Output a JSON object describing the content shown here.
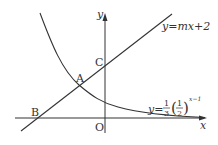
{
  "diagram": {
    "axes": {
      "x_label": "x",
      "y_label": "y",
      "origin_label": "O"
    },
    "points": {
      "A": "A",
      "B": "B",
      "C": "C"
    },
    "line": {
      "label_prefix": "y=",
      "label_expr": "mx+2"
    },
    "curve": {
      "label_prefix": "y=",
      "coef_num": "1",
      "coef_den": "3",
      "base_num": "1",
      "base_den": "2",
      "exponent": "x−1",
      "lparen": "(",
      "rparen": ")"
    }
  }
}
